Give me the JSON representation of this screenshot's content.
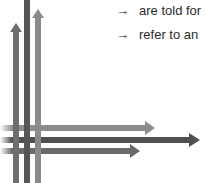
{
  "bullets": [
    {
      "icon": "→",
      "text": "are told for"
    },
    {
      "icon": "→",
      "text": "refer to an"
    }
  ],
  "colors": {
    "vertical_left": "#6e6e6e",
    "vertical_middle": "#555555",
    "vertical_right": "#8a8a8a",
    "horizontal_top": "#8c8c8c",
    "horizontal_middle": "#505050",
    "horizontal_bottom": "#6a6a6a"
  }
}
